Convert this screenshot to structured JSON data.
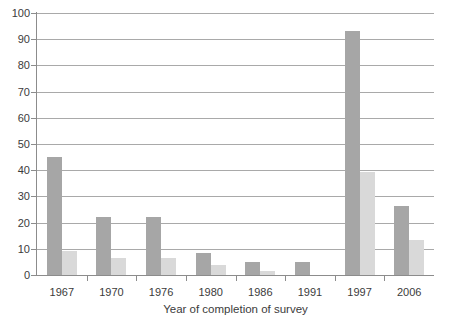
{
  "chart_data": {
    "type": "bar",
    "title": "",
    "subtitle": "",
    "xlabel": "Year of completion of survey",
    "ylabel": "",
    "categories": [
      "1967",
      "1970",
      "1976",
      "1980",
      "1986",
      "1991",
      "1997",
      "2006"
    ],
    "series": [
      {
        "name": "series-1",
        "color": "#a6a6a6",
        "values": [
          45,
          22,
          22,
          8.5,
          5,
          5,
          93,
          26.5
        ]
      },
      {
        "name": "series-2",
        "color": "#d9d9d9",
        "values": [
          9,
          6.5,
          6.5,
          4,
          1.5,
          0,
          39.5,
          13.5
        ]
      }
    ],
    "ylim": [
      0,
      100
    ],
    "yticks": [
      0,
      10,
      20,
      30,
      40,
      50,
      60,
      70,
      80,
      90,
      100
    ],
    "ytick_labels": [
      "0",
      "10",
      "20",
      "30",
      "40",
      "50",
      "60",
      "70",
      "80",
      "90",
      "100"
    ],
    "grid": true,
    "grid_axis": "y",
    "legend": false,
    "legend_position": "none",
    "colors": {
      "series_1": "#a6a6a6",
      "series_2": "#d9d9d9",
      "gridline": "#a9a9a9",
      "axis": "#8c8c8c",
      "text": "#3b3b3b",
      "background": "#ffffff"
    }
  }
}
